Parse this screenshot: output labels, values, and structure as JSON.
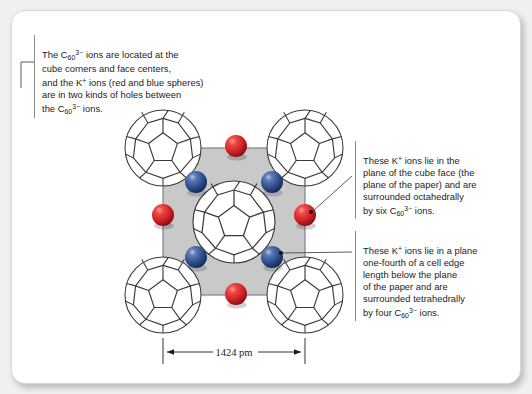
{
  "figure": {
    "compound_anion": "C60(3-)",
    "cation": "K+",
    "notes": {
      "top": {
        "lines": [
          "The C₆₀³⁻ ions are located at the",
          "cube corners and face centers,",
          "and the K⁺ ions (red and blue spheres)",
          "are in two kinds of holes between",
          "the C₆₀³⁻ ions."
        ],
        "text": "The C60 3- ions are located at the cube corners and face centers, and the K+ ions (red and blue spheres) are in two kinds of holes between the C60 3- ions."
      },
      "octahedral": {
        "lines": [
          "These K⁺ ions lie in the",
          "plane of the cube face (the",
          "plane of the paper) and are",
          "surrounded octahedrally",
          "by six C₆₀³⁻ ions."
        ],
        "text": "These K+ ions lie in the plane of the cube face (the plane of the paper) and are surrounded octahedrally by six C60 3- ions."
      },
      "tetrahedral": {
        "lines": [
          "These K⁺ ions lie in a plane",
          "one-fourth of a cell edge",
          "length below the plane",
          "of the paper and are",
          "surrounded tetrahedrally",
          "by four C₆₀³⁻ ions."
        ],
        "text": "These K+ ions lie in a plane one-fourth of a cell edge length below the plane of the paper and are surrounded tetrahedrally by four C60 3- ions."
      }
    },
    "dimension": {
      "value": "1424",
      "unit": "pm",
      "label": "1424 pm"
    },
    "colors": {
      "octahedral_sphere": "#cf2128",
      "tetrahedral_sphere": "#2e4f8f",
      "unit_cell_fill": "#c9c9c9",
      "cell_edge": "#6e6e6e",
      "cage_stroke": "#3a3a3a",
      "card_background": "#ffffff",
      "page_background": "#f0f0f0",
      "text": "#1b1b1b"
    },
    "structure": {
      "lattice": "face-centered cubic",
      "cell_left": 163,
      "cell_top": 148,
      "cell_size": 142,
      "cages": [
        {
          "name": "cage-corner-top-left",
          "cx": 163,
          "cy": 148,
          "r": 38
        },
        {
          "name": "cage-corner-top-right",
          "cx": 305,
          "cy": 148,
          "r": 38
        },
        {
          "name": "cage-corner-bottom-left",
          "cx": 163,
          "cy": 295,
          "r": 38
        },
        {
          "name": "cage-corner-bottom-right",
          "cx": 305,
          "cy": 295,
          "r": 38
        },
        {
          "name": "cage-face-center",
          "cx": 234,
          "cy": 222,
          "r": 41
        }
      ],
      "octahedral_sites": [
        {
          "name": "k-octahedral-top",
          "cx": 236,
          "cy": 146,
          "r": 11
        },
        {
          "name": "k-octahedral-left",
          "cx": 163,
          "cy": 215,
          "r": 11
        },
        {
          "name": "k-octahedral-right",
          "cx": 305,
          "cy": 215,
          "r": 11
        },
        {
          "name": "k-octahedral-bottom",
          "cx": 236,
          "cy": 294,
          "r": 11
        }
      ],
      "tetrahedral_sites": [
        {
          "name": "k-tetrahedral-top-left",
          "cx": 196,
          "cy": 182,
          "r": 11
        },
        {
          "name": "k-tetrahedral-top-right",
          "cx": 272,
          "cy": 182,
          "r": 11
        },
        {
          "name": "k-tetrahedral-bottom-left",
          "cx": 196,
          "cy": 257,
          "r": 11
        },
        {
          "name": "k-tetrahedral-bottom-right",
          "cx": 272,
          "cy": 257,
          "r": 11
        }
      ]
    }
  }
}
